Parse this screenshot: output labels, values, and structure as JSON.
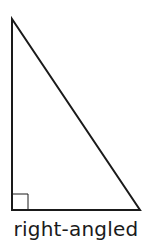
{
  "figure": {
    "caption": "right-angled",
    "shape": "triangle",
    "type": "right-angled triangle",
    "right_angle_marker": "square-icon",
    "vertices": {
      "top": [
        12,
        19
      ],
      "bottom_left": [
        12,
        210
      ],
      "bottom_right": [
        140,
        210
      ]
    },
    "stroke_color": "#1a1a1a",
    "background_color": "#ffffff"
  }
}
